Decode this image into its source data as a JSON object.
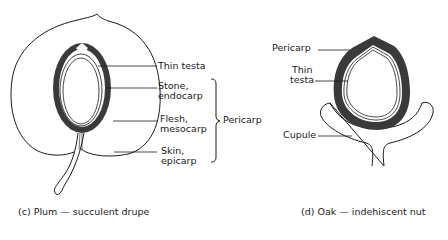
{
  "figure_c": {
    "caption": "(c) Plum — succulent drupe",
    "labels": {
      "thin_testa": "Thin testa",
      "stone_1": "Stone,",
      "stone_2": "endocarp",
      "flesh_1": "Flesh,",
      "flesh_2": "mesocarp",
      "skin_1": "Skin,",
      "skin_2": "epicarp",
      "bracket": "Pericarp"
    }
  },
  "figure_d": {
    "caption": "(d) Oak — indehiscent nut",
    "labels": {
      "pericarp": "Pericarp",
      "testa_1": "Thin",
      "testa_2": "testa",
      "cupule": "Cupule"
    }
  },
  "colors": {
    "line": "#1a1a1a",
    "shell": "#3a3a3a",
    "background": "#ffffff"
  }
}
